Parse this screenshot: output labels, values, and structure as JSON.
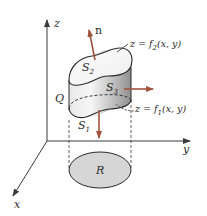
{
  "figure": {
    "axes": {
      "z_label": "z",
      "y_label": "y",
      "x_label": "x"
    },
    "labels": {
      "normal": "n",
      "solid": "Q",
      "region": "R",
      "s1": "S",
      "s1_sub": "1",
      "s2": "S",
      "s2_sub": "2",
      "s3": "S",
      "s3_sub": "3",
      "top_surface": "z = f",
      "top_surface_sub": "2",
      "top_surface_args": "(x, y)",
      "bottom_surface": "z = f",
      "bottom_surface_sub": "1",
      "bottom_surface_args": "(x, y)"
    },
    "colors": {
      "arrow": "#a0523a",
      "axis": "#3a3a3a",
      "surface_light": "#f4f4f4",
      "surface_dark": "#9a9a9a",
      "region_fill": "#d6d6d6"
    }
  }
}
